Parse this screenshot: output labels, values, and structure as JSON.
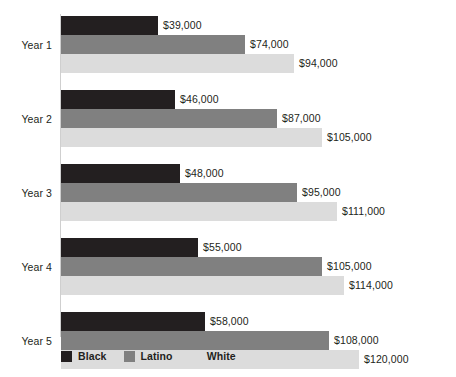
{
  "chart_data": {
    "type": "bar",
    "orientation": "horizontal",
    "title": "",
    "subtitle": "",
    "xlabel": "",
    "ylabel": "",
    "grid": false,
    "legend_position": "bottom-left",
    "xlim": [
      0,
      120000
    ],
    "categories": [
      "Year 1",
      "Year 2",
      "Year 3",
      "Year 4",
      "Year 5"
    ],
    "series": [
      {
        "name": "Black",
        "color": "#231f20",
        "values": [
          39000,
          46000,
          48000,
          55000,
          58000
        ],
        "labels": [
          "$39,000",
          "$46,000",
          "$48,000",
          "$55,000",
          "$58,000"
        ]
      },
      {
        "name": "Latino",
        "color": "#808080",
        "values": [
          74000,
          87000,
          95000,
          105000,
          108000
        ],
        "labels": [
          "$74,000",
          "$87,000",
          "$95,000",
          "$105,000",
          "$108,000"
        ]
      },
      {
        "name": "White",
        "color": "#dcdcdc",
        "values": [
          94000,
          105000,
          111000,
          114000,
          120000
        ],
        "labels": [
          "$94,000",
          "$105,000",
          "$111,000",
          "$114,000",
          "$120,000"
        ]
      }
    ]
  },
  "legend": {
    "items": [
      {
        "label": "Black",
        "color": "#231f20"
      },
      {
        "label": "Latino",
        "color": "#808080"
      },
      {
        "label": "White",
        "color": "#dcdcdc"
      }
    ]
  },
  "axis": {
    "line_color": "#cfcfcf"
  }
}
